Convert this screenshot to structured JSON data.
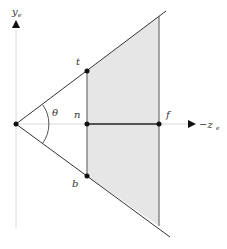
{
  "diagram": {
    "title": "",
    "type": "view-frustum-side-view",
    "colors": {
      "background": "#ffffff",
      "frustum_fill": "#e6e6e6",
      "lines": "#333333",
      "axis": "#d8d8d8",
      "points": "#111111"
    },
    "axes": {
      "y": {
        "label": "y",
        "subscript": "e"
      },
      "z": {
        "label": "−z",
        "subscript": "e"
      }
    },
    "angle": {
      "label": "θ"
    },
    "points": {
      "top": {
        "label": "t"
      },
      "near": {
        "label": "n"
      },
      "bottom": {
        "label": "b"
      },
      "far": {
        "label": "f"
      }
    }
  }
}
